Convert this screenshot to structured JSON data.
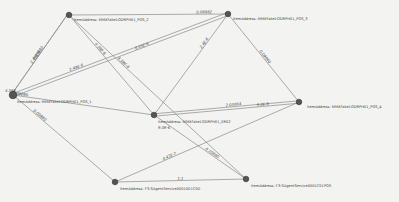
{
  "graph": {
    "nodes": [
      {
        "id": "pos2",
        "label": "ItemAddress: MMXFake1ODRPH01_POS_2"
      },
      {
        "id": "pos3",
        "label": "ItemAddress: MMXFake1ODRPH01_POS_3"
      },
      {
        "id": "pos1",
        "label": "ItemAddress: MMXFake1ODRPH01_POS_1"
      },
      {
        "id": "er02",
        "label": "ItemAddress: MMXFake1ODRPH01_ER02"
      },
      {
        "id": "pos4",
        "label": "ItemAddress: MMXFake1ODRPH01_POS_4"
      },
      {
        "id": "agent1",
        "label": "ItemAddress: F3:SAgentService0001001C0D"
      },
      {
        "id": "agent2",
        "label": "ItemAddress: F3:SAgentService0001C01POS"
      }
    ],
    "edges": [
      {
        "from": "pos2",
        "to": "pos3",
        "label": "0.08882"
      },
      {
        "from": "pos2",
        "to": "pos1",
        "label": "0.09880"
      },
      {
        "from": "pos1",
        "to": "pos2",
        "label": "2.49E-6"
      },
      {
        "from": "pos2",
        "to": "er02",
        "label": "4.38E-6"
      },
      {
        "from": "pos2",
        "to": "agent2",
        "label": "4.38E-6"
      },
      {
        "from": "pos1",
        "to": "pos3",
        "label": "8.05E-6"
      },
      {
        "from": "pos1",
        "to": "pos3",
        "label": "2.49E-6"
      },
      {
        "from": "pos3",
        "to": "er02",
        "label": "2.4E-6"
      },
      {
        "from": "pos3",
        "to": "pos4",
        "label": "0.09880"
      },
      {
        "from": "pos1",
        "to": "er02",
        "label": "0.09880"
      },
      {
        "from": "er02",
        "to": "pos4",
        "label": "2.03964"
      },
      {
        "from": "er02",
        "to": "pos4",
        "label": "9.3E-8"
      },
      {
        "from": "pos4",
        "to": "agent1",
        "label": "4.43E-7"
      },
      {
        "from": "er02",
        "to": "agent2",
        "label": "0.10880"
      },
      {
        "from": "pos1",
        "to": "agent1",
        "label": "0.09880"
      },
      {
        "from": "agent1",
        "to": "agent2",
        "label": "1.1"
      }
    ],
    "extra_labels": {
      "pos1_near": "4.38E",
      "er02_below": "9.3E-6"
    }
  }
}
